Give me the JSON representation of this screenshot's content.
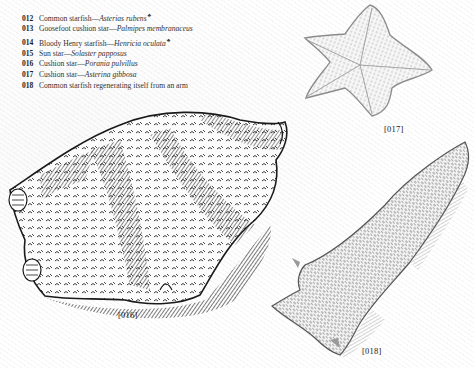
{
  "captions": [
    {
      "num": "012",
      "common": "Common starfish",
      "dash": "—",
      "latin": "Asterias rubens",
      "mark": "♣"
    },
    {
      "num": "013",
      "common": "Goosefoot cushion star",
      "dash": "—",
      "latin": "Palmipes membranaceus",
      "mark": ""
    },
    {
      "num": "014",
      "common": "Bloody Henry starfish",
      "dash": "—",
      "latin": "Henricia oculata",
      "mark": "♣"
    },
    {
      "num": "015",
      "common": "Sun star",
      "dash": "—",
      "latin": "Solaster papposus",
      "mark": ""
    },
    {
      "num": "016",
      "common": "Cushion star",
      "dash": "—",
      "latin": "Porania pulvillus",
      "mark": ""
    },
    {
      "num": "017",
      "common": "Cushion star",
      "dash": "—",
      "latin": "Asterina gibbosa",
      "mark": ""
    },
    {
      "num": "018",
      "common": "Common starfish regenerating itself from an arm",
      "dash": "",
      "latin": "",
      "mark": ""
    }
  ],
  "figures": {
    "fig016": {
      "label": "[016]",
      "subject": "Cushion star (Porania pulvillus) engraving"
    },
    "fig017": {
      "label": "[017]",
      "subject": "Cushion star (Asterina gibbosa) engraving"
    },
    "fig018": {
      "label": "[018]",
      "subject": "Common starfish regenerating from an arm engraving"
    }
  },
  "colors": {
    "ink": "#2a2a2a",
    "paper": "#ffffff",
    "light_ink": "#9a9a9a"
  }
}
